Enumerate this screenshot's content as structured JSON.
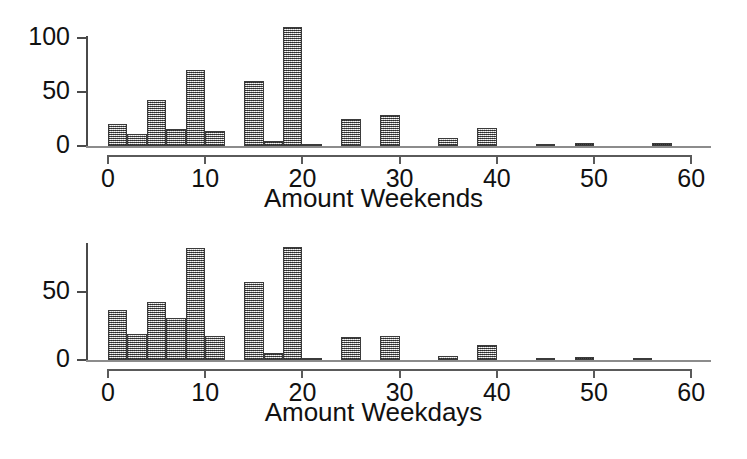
{
  "chart_data": [
    {
      "type": "bar",
      "title": "",
      "xlabel": "Amount Weekends",
      "ylabel": "",
      "xlim": [
        -1,
        61
      ],
      "ylim": [
        0,
        115
      ],
      "grid": false,
      "legend": "none",
      "bin_width": 2,
      "xticks": [
        0,
        10,
        20,
        30,
        40,
        50,
        60
      ],
      "xtick_labels": [
        "0",
        "10",
        "20",
        "30",
        "40",
        "50",
        "60"
      ],
      "yticks": [
        0,
        50,
        100
      ],
      "ytick_labels": [
        "0",
        "50",
        "100"
      ],
      "bin_starts": [
        0,
        2,
        4,
        6,
        8,
        10,
        12,
        14,
        16,
        18,
        20,
        22,
        24,
        26,
        28,
        30,
        32,
        34,
        36,
        38,
        40,
        42,
        44,
        46,
        48,
        50,
        52,
        54,
        56,
        58
      ],
      "values": [
        20,
        11,
        43,
        16,
        70,
        14,
        0,
        60,
        5,
        110,
        2,
        0,
        25,
        0,
        29,
        0,
        0,
        7,
        0,
        17,
        0,
        0,
        2,
        0,
        3,
        0,
        0,
        0,
        3,
        0
      ]
    },
    {
      "type": "bar",
      "title": "",
      "xlabel": "Amount Weekdays",
      "ylabel": "",
      "xlim": [
        -1,
        61
      ],
      "ylim": [
        0,
        88
      ],
      "grid": false,
      "legend": "none",
      "bin_width": 2,
      "xticks": [
        0,
        10,
        20,
        30,
        40,
        50,
        60
      ],
      "xtick_labels": [
        "0",
        "10",
        "20",
        "30",
        "40",
        "50",
        "60"
      ],
      "yticks": [
        0,
        50
      ],
      "ytick_labels": [
        "0",
        "50"
      ],
      "bin_starts": [
        0,
        2,
        4,
        6,
        8,
        10,
        12,
        14,
        16,
        18,
        20,
        22,
        24,
        26,
        28,
        30,
        32,
        34,
        36,
        38,
        40,
        42,
        44,
        46,
        48,
        50,
        52,
        54,
        56,
        58
      ],
      "values": [
        37,
        19,
        43,
        31,
        82,
        18,
        0,
        57,
        5,
        83,
        1,
        0,
        17,
        0,
        18,
        0,
        0,
        3,
        0,
        11,
        0,
        0,
        1,
        0,
        2,
        0,
        0,
        1,
        0,
        0
      ]
    }
  ],
  "panels": {
    "weekends": {
      "axis_title": "Amount Weekends",
      "y_tick_labels": [
        "100",
        "50",
        "0"
      ],
      "x_tick_labels": [
        "0",
        "10",
        "20",
        "30",
        "40",
        "50",
        "60"
      ]
    },
    "weekdays": {
      "axis_title": "Amount Weekdays",
      "y_tick_labels": [
        "50",
        "0"
      ],
      "x_tick_labels": [
        "0",
        "10",
        "20",
        "30",
        "40",
        "50",
        "60"
      ]
    }
  },
  "style": {
    "bar_fill": "#8f8f8f",
    "bar_edge": "#3b3b3b",
    "axis_color": "#4a4a4a",
    "text_color": "#111111",
    "background": "#ffffff"
  }
}
